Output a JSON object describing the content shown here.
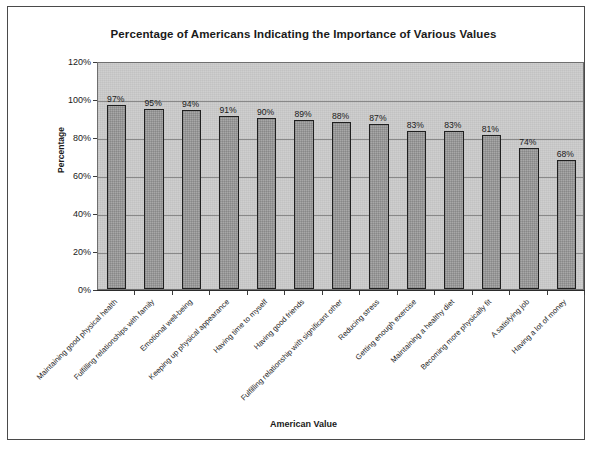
{
  "chart_data": {
    "type": "bar",
    "title": "Percentage of Americans Indicating the Importance of Various Values",
    "xlabel": "American Value",
    "ylabel": "Percentage",
    "ylim": [
      0,
      120
    ],
    "ytick_labels": [
      "0%",
      "20%",
      "40%",
      "60%",
      "80%",
      "100%",
      "120%"
    ],
    "ytick_values": [
      0,
      20,
      40,
      60,
      80,
      100,
      120
    ],
    "grid": true,
    "legend": "none",
    "categories": [
      "Maintaining good physical health",
      "Fulfilling relationships with family",
      "Emotional well-being",
      "Keeping up physical appearance",
      "Having time to myself",
      "Having good friends",
      "Fulfilling relationship with significant other",
      "Reducing stress",
      "Getting enough exercise",
      "Maintaining a healthy diet",
      "Becoming more physically fit",
      "A satisfying job",
      "Having a lot of money"
    ],
    "values": [
      97,
      95,
      94,
      91,
      90,
      89,
      88,
      87,
      83,
      83,
      81,
      74,
      68
    ],
    "value_labels": [
      "97%",
      "95%",
      "94%",
      "91%",
      "90%",
      "89%",
      "88%",
      "87%",
      "83%",
      "83%",
      "81%",
      "74%",
      "68%"
    ],
    "colors": {
      "bar_fill": "#a8a8a8",
      "bar_edge": "#1f1f1f",
      "plot_background": "#cfcfcf",
      "gridline": "#7d7d7d",
      "text": "#1a1a1a",
      "frame": "#4a4a4a"
    }
  }
}
